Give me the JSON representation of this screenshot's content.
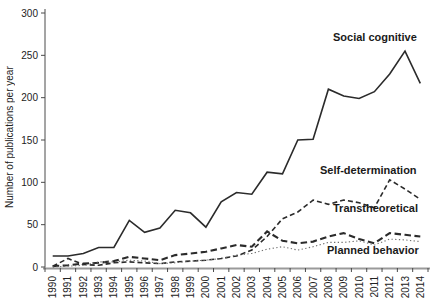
{
  "chart_data": {
    "type": "line",
    "title": "",
    "xlabel": "",
    "ylabel": "Number of publications per year",
    "ylim": [
      0,
      300
    ],
    "y_ticks": [
      0,
      50,
      100,
      150,
      200,
      250,
      300
    ],
    "grid": false,
    "legend": "inline-labels-right",
    "x": [
      "1990",
      "1991",
      "1992",
      "1993",
      "1994",
      "1995",
      "1996",
      "1997",
      "1998",
      "1999",
      "2000",
      "2001",
      "2002",
      "2003",
      "2004",
      "2005",
      "2006",
      "2007",
      "2008",
      "2009",
      "2010",
      "2011",
      "2012",
      "2013",
      "2014"
    ],
    "series": [
      {
        "name": "Social cognitive",
        "style": "solid",
        "color": "#2b2b2b",
        "values": [
          13,
          13,
          16,
          23,
          23,
          55,
          41,
          46,
          67,
          64,
          47,
          77,
          88,
          86,
          112,
          110,
          150,
          151,
          210,
          202,
          199,
          207,
          228,
          255,
          217
        ]
      },
      {
        "name": "Self-determination",
        "style": "dashed",
        "color": "#2b2b2b",
        "values": [
          1,
          10,
          3,
          2,
          5,
          6,
          5,
          4,
          6,
          7,
          8,
          10,
          13,
          20,
          36,
          57,
          65,
          79,
          74,
          79,
          76,
          70,
          103,
          92,
          80
        ]
      },
      {
        "name": "Transtheoretical",
        "style": "long-dash",
        "color": "#2b2b2b",
        "values": [
          1,
          2,
          4,
          5,
          7,
          12,
          10,
          8,
          14,
          16,
          18,
          22,
          26,
          24,
          42,
          31,
          28,
          30,
          36,
          40,
          33,
          28,
          40,
          38,
          36
        ]
      },
      {
        "name": "Planned behavior",
        "style": "dotted",
        "color": "#6e6e6e",
        "values": [
          0,
          1,
          2,
          6,
          6,
          8,
          7,
          4,
          5,
          7,
          8,
          10,
          14,
          16,
          21,
          24,
          20,
          24,
          29,
          29,
          31,
          26,
          33,
          32,
          30
        ]
      }
    ],
    "axis_colors": {
      "y_axis": "#4a4a4a",
      "x_axis": "#9a9a9a",
      "tick_text": "#222222"
    }
  }
}
